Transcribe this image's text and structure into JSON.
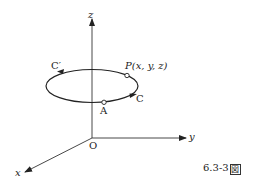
{
  "figure": {
    "caption_number": "6.3-3",
    "caption_suffix": "図",
    "axes": {
      "z_label": "z",
      "y_label": "y",
      "x_label": "x",
      "origin_label": "O"
    },
    "curve": {
      "name_forward": "C",
      "name_reverse": "C′",
      "point_a_label": "A",
      "point_p_label": "P(x, y, z)"
    },
    "colors": {
      "stroke": "#222222",
      "background": "#ffffff"
    }
  }
}
